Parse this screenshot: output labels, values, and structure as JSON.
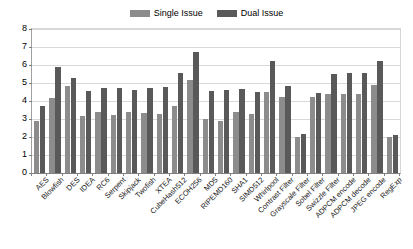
{
  "legend": {
    "entries": [
      {
        "label": "Single Issue",
        "color": "#8c8c8c"
      },
      {
        "label": "Dual Issue",
        "color": "#595959"
      }
    ]
  },
  "axes": {
    "y_ticks": [
      "0",
      "1",
      "2",
      "3",
      "4",
      "5",
      "6",
      "7",
      "8"
    ]
  },
  "chart_data": {
    "type": "bar",
    "title": "",
    "subtitle": "",
    "xlabel": "",
    "ylabel": "",
    "ylim": [
      0,
      8
    ],
    "ytick_step": 1,
    "grid": true,
    "legend_position": "top-center",
    "categories": [
      "AES",
      "Blowfish",
      "DES",
      "IDEA",
      "RC6",
      "Serpent",
      "Skipjack",
      "Twofish",
      "XTEA",
      "CubeHash512",
      "ECOH256",
      "MD5",
      "RIPEMD160",
      "SHA1",
      "SIMD512",
      "Whirlpool",
      "Contrast Filter",
      "Grayscale Filter",
      "Sobel Filter",
      "Swizzle Filter",
      "ADPCM encode",
      "ADPCM decode",
      "JPEG encode",
      "RegExp"
    ],
    "series": [
      {
        "name": "Single Issue",
        "color": "#8c8c8c",
        "values": [
          2.9,
          4.15,
          4.85,
          3.15,
          3.4,
          3.25,
          3.4,
          3.35,
          3.3,
          3.7,
          5.15,
          3.0,
          2.9,
          3.4,
          3.3,
          4.5,
          4.25,
          2.0,
          4.25,
          4.4,
          4.4,
          4.4,
          4.9,
          2.0
        ]
      },
      {
        "name": "Dual Issue",
        "color": "#595959",
        "values": [
          3.75,
          5.9,
          5.3,
          4.55,
          4.75,
          4.7,
          4.6,
          4.75,
          4.8,
          5.55,
          6.7,
          4.55,
          4.6,
          4.65,
          4.5,
          6.2,
          4.85,
          2.15,
          4.45,
          5.5,
          5.55,
          5.55,
          6.2,
          2.1
        ]
      }
    ]
  }
}
